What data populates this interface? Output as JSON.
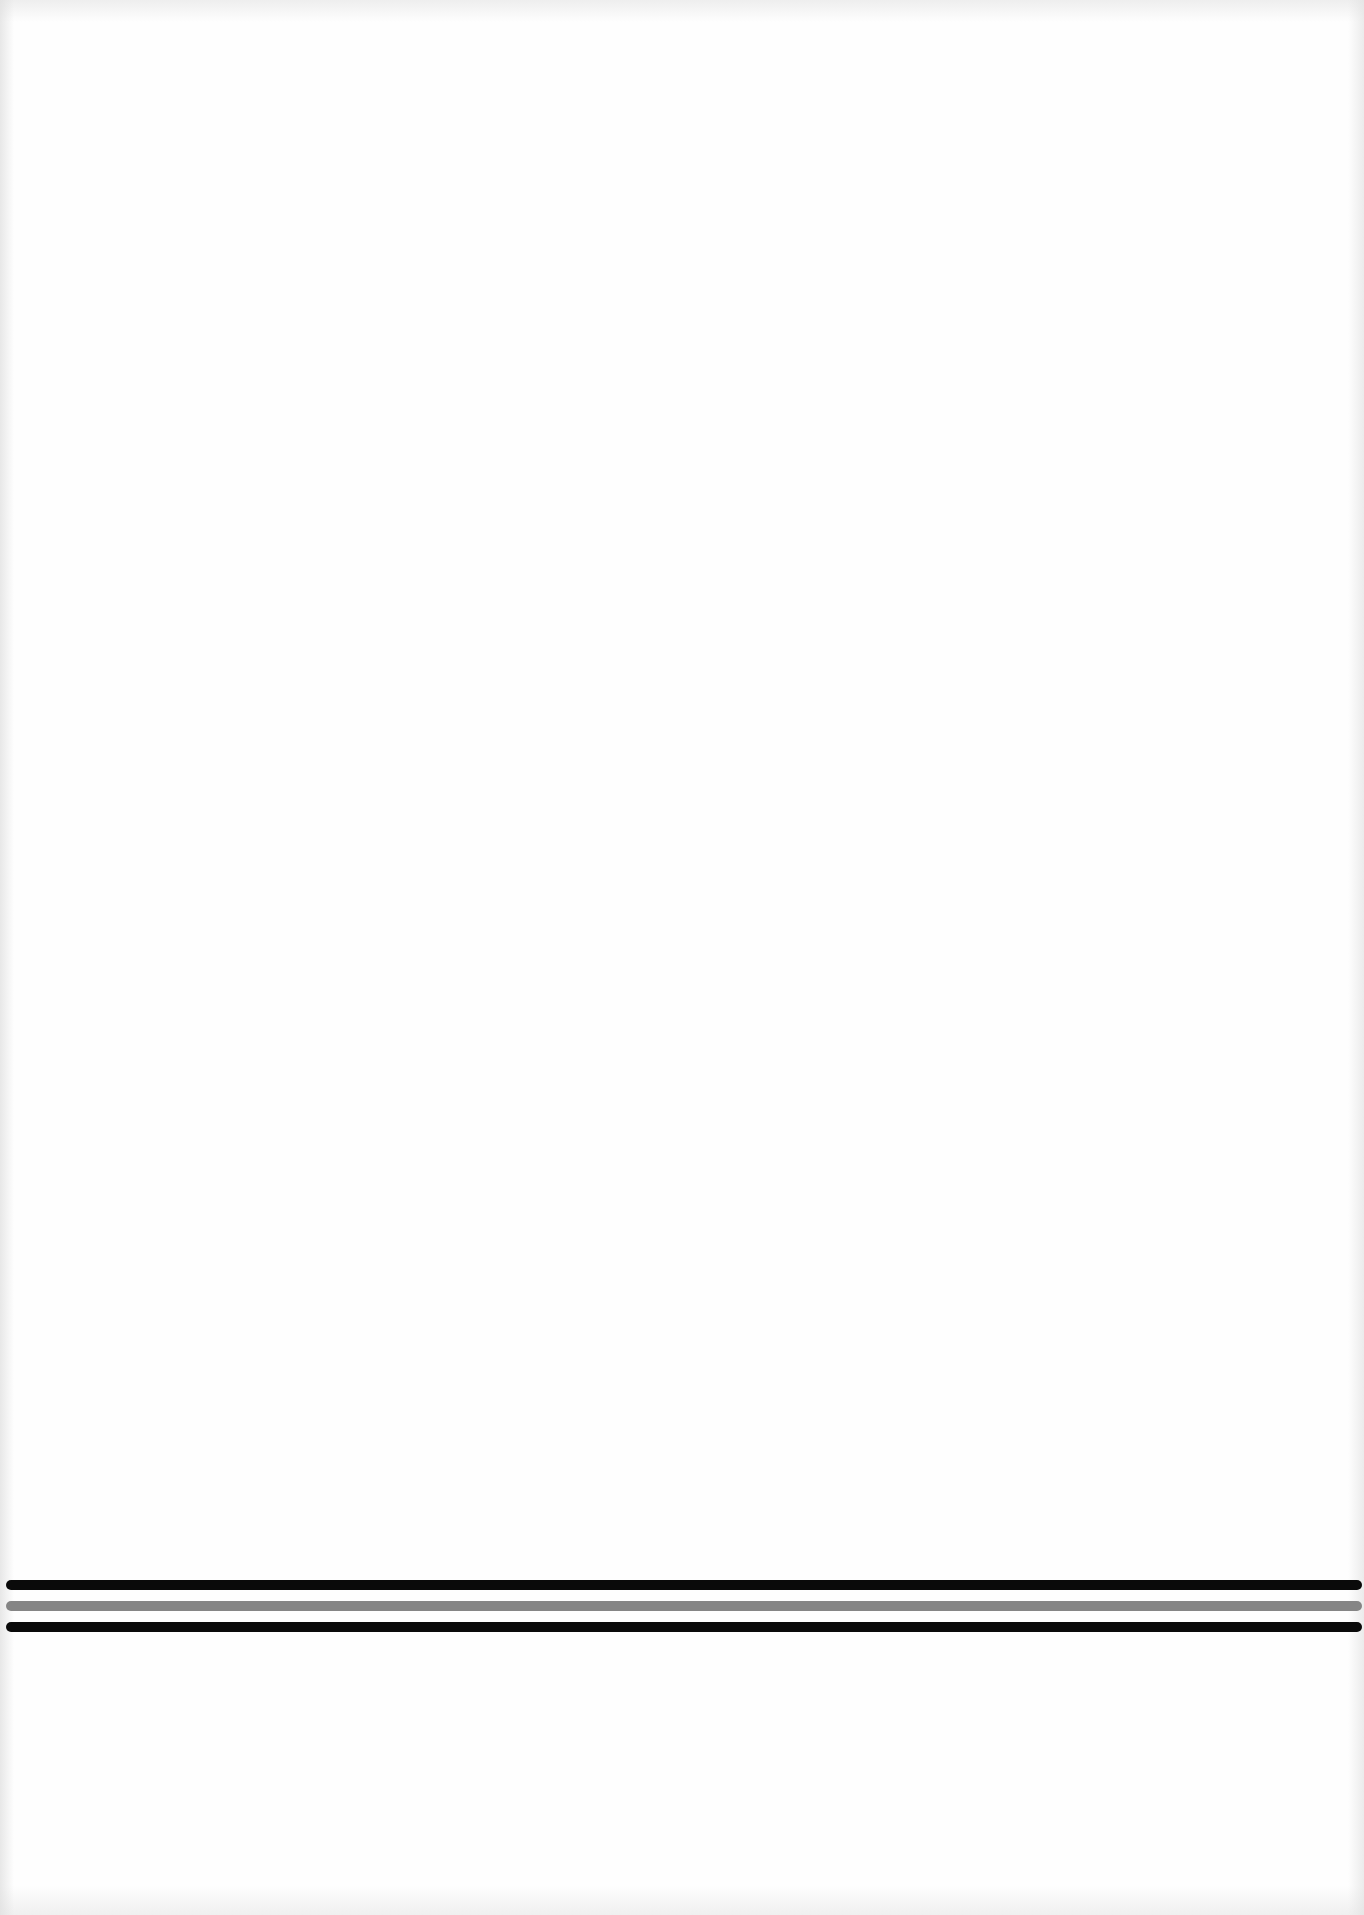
{
  "document": {
    "type": "scanned-page",
    "background_color": "#fefefe",
    "body_text": ""
  },
  "rules": [
    {
      "name": "top-black-rule",
      "color": "#0a0a0a",
      "top": 1580,
      "thickness": 10
    },
    {
      "name": "middle-gray-rule",
      "color": "#858585",
      "top": 1601,
      "thickness": 10
    },
    {
      "name": "bottom-black-rule",
      "color": "#0a0a0a",
      "top": 1622,
      "thickness": 10
    }
  ]
}
